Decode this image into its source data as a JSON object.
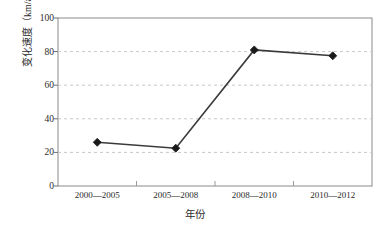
{
  "chart_data": {
    "type": "line",
    "title": "",
    "xlabel": "年份",
    "ylabel": "变化速度（km/a）",
    "categories": [
      "2000—2005",
      "2005—2008",
      "2008—2010",
      "2010—2012"
    ],
    "values": [
      26,
      22.5,
      81,
      77.5
    ],
    "series": [
      {
        "name": "变化速度",
        "values": [
          26,
          22.5,
          81,
          77.5
        ]
      }
    ],
    "ylim": [
      0,
      100
    ],
    "yticks": [
      0,
      20,
      40,
      60,
      80,
      100
    ],
    "ytick_labels": [
      "0",
      "20",
      "40",
      "60",
      "80",
      "100"
    ],
    "grid": "horizontal-dashed",
    "legend": "none",
    "marker": "diamond",
    "line_color": "#3a3a3a",
    "marker_color": "#1a1a1a",
    "grid_color": "#c8c8c8",
    "axis_color": "#808080",
    "background": "#ffffff"
  },
  "axes": {
    "y_title": "变化速度（km/a）",
    "x_title": "年份"
  }
}
